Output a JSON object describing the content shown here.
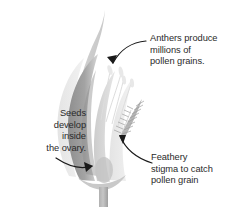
{
  "figure": {
    "kind": "botanical-diagram",
    "background_color": "#ffffff",
    "text_color": "#2a2a2a"
  },
  "annotations": [
    {
      "id": "anthers",
      "text": "Anthers produce\nmillions of\npollen grains.",
      "align": "left",
      "points_to": "anthers"
    },
    {
      "id": "seeds",
      "text": "Seeds\ndevelop\ninside\nthe ovary.",
      "align": "right",
      "points_to": "ovary"
    },
    {
      "id": "stigma",
      "text": "Feathery\nstigma to catch\npollen grain",
      "align": "left",
      "points_to": "stigma"
    }
  ],
  "illustration": {
    "parts": [
      {
        "name": "awn",
        "color": "#c9c9c9"
      },
      {
        "name": "lemma-dark-leaf",
        "color": "#9a9a9a"
      },
      {
        "name": "palea-light-leaf",
        "color": "#cfcfcf"
      },
      {
        "name": "glume-pale",
        "color": "#e2e2e2"
      },
      {
        "name": "feathery-stigma",
        "color": "#a8a8a8"
      },
      {
        "name": "anther-filaments",
        "color": "#e0e0e0"
      },
      {
        "name": "ovary",
        "color": "#bdbdbd"
      },
      {
        "name": "stem",
        "color": "#b4b4b4"
      }
    ],
    "arrow_color": "#1a1a1a"
  }
}
